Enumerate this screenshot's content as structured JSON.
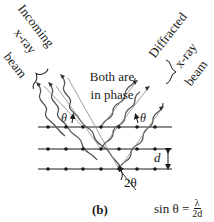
{
  "figure": {
    "panel_label": "(b)",
    "incoming_label": [
      "Incoming",
      "x-ray",
      "beam"
    ],
    "diffracted_label": [
      "Diffracted",
      "x-ray",
      "beam"
    ],
    "phase_label": [
      "Both are",
      "in phase"
    ],
    "theta_left": "θ",
    "theta_right": "θ",
    "two_theta": "2θ",
    "spacing_label": "d",
    "formula": {
      "lhs": "sin θ =",
      "numerator": "λ",
      "denominator": "2d"
    },
    "lattice": {
      "rows": 3,
      "atoms_per_row": 7,
      "row_y": [
        127,
        149,
        169
      ],
      "atom_x": [
        48,
        66,
        83,
        101,
        119,
        137,
        155
      ]
    },
    "colors": {
      "ink": "#1a1a1a",
      "wave": "#555555",
      "background": "#ffffff"
    }
  }
}
